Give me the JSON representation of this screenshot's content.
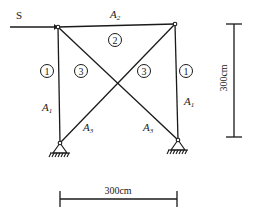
{
  "diagram": {
    "type": "truss",
    "load": {
      "label": "S",
      "direction": "right"
    },
    "members": {
      "top": {
        "area": "A",
        "area_sub": "2",
        "id": "2"
      },
      "left": {
        "area": "A",
        "area_sub": "1",
        "id": "1"
      },
      "right": {
        "area": "A",
        "area_sub": "1",
        "id": "1"
      },
      "diag_left": {
        "area": "A",
        "area_sub": "3",
        "id": "3"
      },
      "diag_right": {
        "area": "A",
        "area_sub": "3",
        "id": "3"
      }
    },
    "dimensions": {
      "height": "300cm",
      "width": "300cm"
    },
    "colors": {
      "line": "#1a1a1a",
      "background": "#ffffff"
    }
  }
}
